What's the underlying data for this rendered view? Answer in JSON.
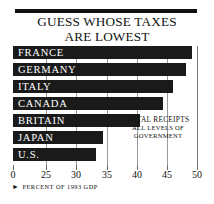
{
  "title": {
    "line1": "GUESS WHOSE TAXES",
    "line2": "ARE LOWEST"
  },
  "annotation": {
    "line1": "TOTAL RECEIPTS",
    "line2": "ALL LEVELS OF",
    "line3": "GOVERNMENT"
  },
  "footnote": {
    "marker": "►",
    "text": "PERCENT OF 1993 GDP"
  },
  "colors": {
    "bar": "#1a1a1a",
    "bar_label": "#ffffff",
    "grid": "#9a9a9a",
    "background": "#ffffff",
    "text": "#111111"
  },
  "chart_data": {
    "type": "bar",
    "orientation": "horizontal",
    "title": "GUESS WHOSE TAXES ARE LOWEST",
    "subtitle": "",
    "xlabel": "PERCENT OF 1993 GDP",
    "ylabel": "",
    "categories": [
      "FRANCE",
      "GERMANY",
      "ITALY",
      "CANADA",
      "BRITAIN",
      "JAPAN",
      "U.S."
    ],
    "values": [
      49.3,
      48.2,
      46.6,
      45.0,
      40.3,
      33.5,
      32.4
    ],
    "value_unit": "percent of GDP",
    "xlim": [
      0,
      50
    ],
    "axis_note": "broken axis: 0 then 25 through 50",
    "xticks": [
      0,
      25,
      30,
      35,
      40,
      45,
      50
    ],
    "xtick_labels": [
      "0",
      "25",
      "30",
      "35",
      "40",
      "45",
      "50"
    ],
    "xtick_positions_px": [
      0,
      33,
      63,
      94,
      124,
      154,
      184
    ],
    "grid": true,
    "legend": false,
    "annotations": [
      "TOTAL RECEIPTS",
      "ALL LEVELS OF",
      "GOVERNMENT"
    ],
    "bar_end_px": [
      179,
      173,
      160,
      150,
      127,
      90,
      83
    ]
  }
}
